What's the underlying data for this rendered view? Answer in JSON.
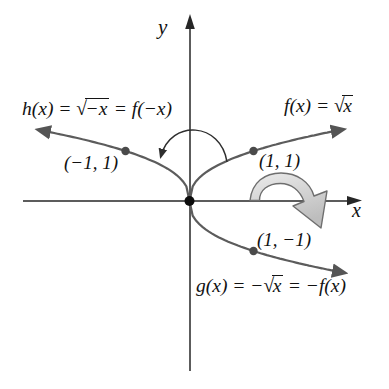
{
  "figure": {
    "background": "#ffffff",
    "curve_color": "#5c5c5c",
    "axis_color": "#262626",
    "dot_color": "#4a4a4a",
    "origin_dot_color": "#0c0c0c",
    "flip_arrow_fill_light": "#e9e9e9",
    "flip_arrow_fill_dark": "#bdbdbd",
    "flip_arrow_stroke": "#6e6e6e"
  },
  "labels": {
    "axes": {
      "x": "x",
      "y": "y"
    },
    "h": {
      "pre": "h(x) = ",
      "sqrt": "√",
      "rad": "−x",
      "post": " = f(−x)"
    },
    "f": {
      "pre": "f(x) = ",
      "sqrt": "√",
      "rad": "x",
      "post": ""
    },
    "g": {
      "pre": "g(x) = −",
      "sqrt": "√",
      "rad": "x",
      "post": " = −f(x)"
    }
  },
  "chart_data": {
    "type": "line",
    "title": "",
    "xlabel": "x",
    "ylabel": "y",
    "grid": false,
    "axes_shown_range": {
      "x": [
        -2.6,
        2.8
      ],
      "y": [
        -3.4,
        3.7
      ]
    },
    "origin_point": [
      0,
      0
    ],
    "series": [
      {
        "id": "f",
        "name": "f(x) = √x",
        "equation": "y = sqrt(x)",
        "domain": [
          0,
          2.4
        ],
        "labeled_point": [
          1,
          1
        ],
        "point_label": "(1, 1)"
      },
      {
        "id": "h",
        "name": "h(x) = √−x = f(−x)",
        "equation": "y = sqrt(−x)",
        "domain": [
          -2.36,
          0
        ],
        "labeled_point": [
          -1,
          1
        ],
        "point_label": "(−1, 1)"
      },
      {
        "id": "g",
        "name": "g(x) = −√x = −f(x)",
        "equation": "y = −sqrt(x)",
        "domain": [
          0,
          2.42
        ],
        "labeled_point": [
          1,
          -1
        ],
        "point_label": "(1, −1)"
      }
    ],
    "annotations": [
      {
        "type": "arc-arrow",
        "meaning": "reflection of f(x) across the y-axis gives h(x)"
      },
      {
        "type": "flip-arrow",
        "meaning": "reflection of f(x) across the x-axis gives g(x)"
      }
    ]
  }
}
